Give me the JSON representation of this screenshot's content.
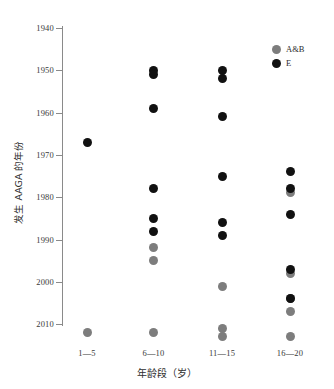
{
  "chart_data": {
    "type": "scatter",
    "title": "",
    "xlabel": "年龄段（岁）",
    "ylabel": "发生 AAGA 的年份",
    "categories": [
      "1—5",
      "6—10",
      "11—15",
      "16—20"
    ],
    "ylim": [
      1940,
      2013
    ],
    "y_inverted": true,
    "yticks": [
      1940,
      1950,
      1960,
      1970,
      1980,
      1990,
      2000,
      2010
    ],
    "ytick_labels": [
      "1940",
      "1950",
      "1960",
      "1970",
      "1980",
      "1990",
      "2000",
      "2010"
    ],
    "grid": false,
    "legend_position": "top-right",
    "colors": {
      "A&B": "#7d7d7d",
      "E": "#111111",
      "axis": "#8a8a8a",
      "background": "#ffffff"
    },
    "legend": [
      {
        "name": "A&B",
        "marker": "circle",
        "color": "#7d7d7d"
      },
      {
        "name": "E",
        "marker": "circle",
        "color": "#111111"
      }
    ],
    "series": [
      {
        "name": "A&B",
        "color": "#7d7d7d",
        "points": [
          {
            "category": "1—5",
            "year": 2012
          },
          {
            "category": "6—10",
            "year": 1992
          },
          {
            "category": "6—10",
            "year": 1995
          },
          {
            "category": "6—10",
            "year": 2012
          },
          {
            "category": "11—15",
            "year": 2001
          },
          {
            "category": "11—15",
            "year": 2011
          },
          {
            "category": "11—15",
            "year": 2013
          },
          {
            "category": "16—20",
            "year": 1979
          },
          {
            "category": "16—20",
            "year": 1998
          },
          {
            "category": "16—20",
            "year": 2004
          },
          {
            "category": "16—20",
            "year": 2007
          },
          {
            "category": "16—20",
            "year": 2013
          }
        ]
      },
      {
        "name": "E",
        "color": "#111111",
        "points": [
          {
            "category": "1—5",
            "year": 1967
          },
          {
            "category": "6—10",
            "year": 1950
          },
          {
            "category": "6—10",
            "year": 1951
          },
          {
            "category": "6—10",
            "year": 1959
          },
          {
            "category": "6—10",
            "year": 1978
          },
          {
            "category": "6—10",
            "year": 1985
          },
          {
            "category": "6—10",
            "year": 1988
          },
          {
            "category": "11—15",
            "year": 1950
          },
          {
            "category": "11—15",
            "year": 1952
          },
          {
            "category": "11—15",
            "year": 1961
          },
          {
            "category": "11—15",
            "year": 1975
          },
          {
            "category": "11—15",
            "year": 1986
          },
          {
            "category": "11—15",
            "year": 1989
          },
          {
            "category": "16—20",
            "year": 1974
          },
          {
            "category": "16—20",
            "year": 1978
          },
          {
            "category": "16—20",
            "year": 1984
          },
          {
            "category": "16—20",
            "year": 1997
          },
          {
            "category": "16—20",
            "year": 2004
          }
        ]
      }
    ]
  }
}
